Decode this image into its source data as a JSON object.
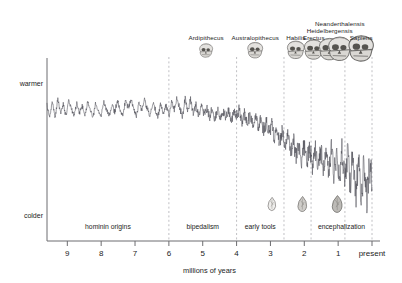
{
  "chart_data": {
    "type": "line",
    "title": "",
    "subtitle": "",
    "xlabel": "millions of years",
    "ylabel": "",
    "xlim": [
      9.6,
      0
    ],
    "ylim": [
      0,
      1
    ],
    "grid": false,
    "legend": null,
    "x_ticks": [
      "9",
      "8",
      "7",
      "6",
      "5",
      "4",
      "3",
      "2",
      "1",
      "present"
    ],
    "x_tick_values": [
      9,
      8,
      7,
      6,
      5,
      4,
      3,
      2,
      1,
      0
    ],
    "y_ticks": [
      "warmer",
      "colder"
    ],
    "y_tick_values": [
      0.88,
      0.14
    ],
    "series": [
      {
        "name": "benthic oxygen isotope climate proxy",
        "description": "noisy climate record, warm and stable before 6 Ma, progressive cooling after 4 Ma with strongly increasing glacial-interglacial amplitude toward present",
        "x": [
          9.6,
          9.52,
          9.44,
          9.36,
          9.28,
          9.2,
          9.12,
          9.04,
          8.96,
          8.88,
          8.8,
          8.72,
          8.64,
          8.56,
          8.48,
          8.4,
          8.32,
          8.24,
          8.16,
          8.08,
          8.0,
          7.92,
          7.84,
          7.76,
          7.68,
          7.6,
          7.52,
          7.44,
          7.36,
          7.28,
          7.2,
          7.12,
          7.04,
          6.96,
          6.88,
          6.8,
          6.72,
          6.64,
          6.56,
          6.48,
          6.4,
          6.32,
          6.24,
          6.16,
          6.08,
          6.0,
          5.92,
          5.84,
          5.76,
          5.68,
          5.6,
          5.52,
          5.44,
          5.36,
          5.28,
          5.2,
          5.12,
          5.04,
          4.96,
          4.88,
          4.8,
          4.72,
          4.64,
          4.56,
          4.48,
          4.4,
          4.32,
          4.24,
          4.16,
          4.08,
          4.0,
          3.92,
          3.84,
          3.76,
          3.68,
          3.6,
          3.52,
          3.44,
          3.36,
          3.28,
          3.2,
          3.12,
          3.04,
          2.96,
          2.88,
          2.8,
          2.72,
          2.64,
          2.56,
          2.48,
          2.4,
          2.32,
          2.24,
          2.16,
          2.08,
          2.0,
          1.92,
          1.84,
          1.76,
          1.68,
          1.6,
          1.52,
          1.44,
          1.36,
          1.28,
          1.2,
          1.12,
          1.04,
          0.96,
          0.88,
          0.8,
          0.72,
          0.64,
          0.56,
          0.48,
          0.4,
          0.32,
          0.24,
          0.16,
          0.08,
          0.0
        ],
        "y": [
          0.76,
          0.7,
          0.79,
          0.69,
          0.8,
          0.72,
          0.77,
          0.7,
          0.79,
          0.745,
          0.7,
          0.78,
          0.72,
          0.76,
          0.705,
          0.78,
          0.735,
          0.69,
          0.775,
          0.73,
          0.7,
          0.78,
          0.74,
          0.7,
          0.77,
          0.725,
          0.79,
          0.735,
          0.7,
          0.79,
          0.745,
          0.8,
          0.74,
          0.7,
          0.78,
          0.73,
          0.795,
          0.745,
          0.7,
          0.78,
          0.735,
          0.7,
          0.77,
          0.72,
          0.76,
          0.7,
          0.79,
          0.735,
          0.81,
          0.74,
          0.7,
          0.8,
          0.73,
          0.79,
          0.72,
          0.77,
          0.7,
          0.76,
          0.71,
          0.75,
          0.69,
          0.745,
          0.685,
          0.74,
          0.68,
          0.735,
          0.69,
          0.745,
          0.68,
          0.72,
          0.7,
          0.745,
          0.665,
          0.72,
          0.66,
          0.71,
          0.64,
          0.7,
          0.63,
          0.69,
          0.62,
          0.67,
          0.6,
          0.655,
          0.575,
          0.64,
          0.55,
          0.62,
          0.52,
          0.6,
          0.495,
          0.58,
          0.47,
          0.56,
          0.455,
          0.545,
          0.43,
          0.54,
          0.42,
          0.535,
          0.405,
          0.53,
          0.395,
          0.525,
          0.38,
          0.52,
          0.36,
          0.515,
          0.34,
          0.51,
          0.32,
          0.505,
          0.3,
          0.495,
          0.27,
          0.48,
          0.24,
          0.46,
          0.21,
          0.44,
          0.3
        ]
      }
    ],
    "eras": [
      {
        "label": "hominin origins",
        "start": 9.6,
        "end": 6.0,
        "center": 7.8
      },
      {
        "label": "bipedalism",
        "start": 6.0,
        "end": 4.0,
        "center": 5.0
      },
      {
        "label": "early tools",
        "start": 4.0,
        "end": 2.6,
        "center": 3.3
      },
      {
        "label": "encephalization",
        "start": 1.8,
        "end": 0.0,
        "center": 0.9
      }
    ],
    "dividers": [
      6.0,
      4.0,
      2.6,
      1.8,
      0.8,
      0.0
    ],
    "species": [
      {
        "label": "Ardipithecus",
        "x": 4.9,
        "icon": "skull-icon",
        "label_row": 0
      },
      {
        "label": "Australopithecus",
        "x": 3.45,
        "icon": "skull-icon",
        "label_row": 0
      },
      {
        "label": "Habilis",
        "x": 2.25,
        "icon": "skull-icon",
        "label_row": 0
      },
      {
        "label": "Erectus",
        "x": 1.72,
        "icon": "skull-icon",
        "label_row": 0
      },
      {
        "label": "Heidelbergensis",
        "x": 1.25,
        "icon": "skull-icon",
        "label_row": 1
      },
      {
        "label": "Neanderthalensis",
        "x": 0.95,
        "icon": "skull-icon",
        "label_row": 2
      },
      {
        "label": "Sapiens",
        "x": 0.32,
        "icon": "skull-icon",
        "label_row": 0
      }
    ],
    "tools": [
      {
        "name": "oldowan-tool-icon",
        "x": 2.95
      },
      {
        "name": "acheulean-tool-icon",
        "x": 2.05
      },
      {
        "name": "mousterian-tool-icon",
        "x": 1.02
      }
    ],
    "colors": {
      "curve": "#4a4a52",
      "axis": "#6d6d70",
      "divider": "#b9b9bd",
      "text": "#1c1c1c",
      "background": "#ffffff"
    }
  }
}
